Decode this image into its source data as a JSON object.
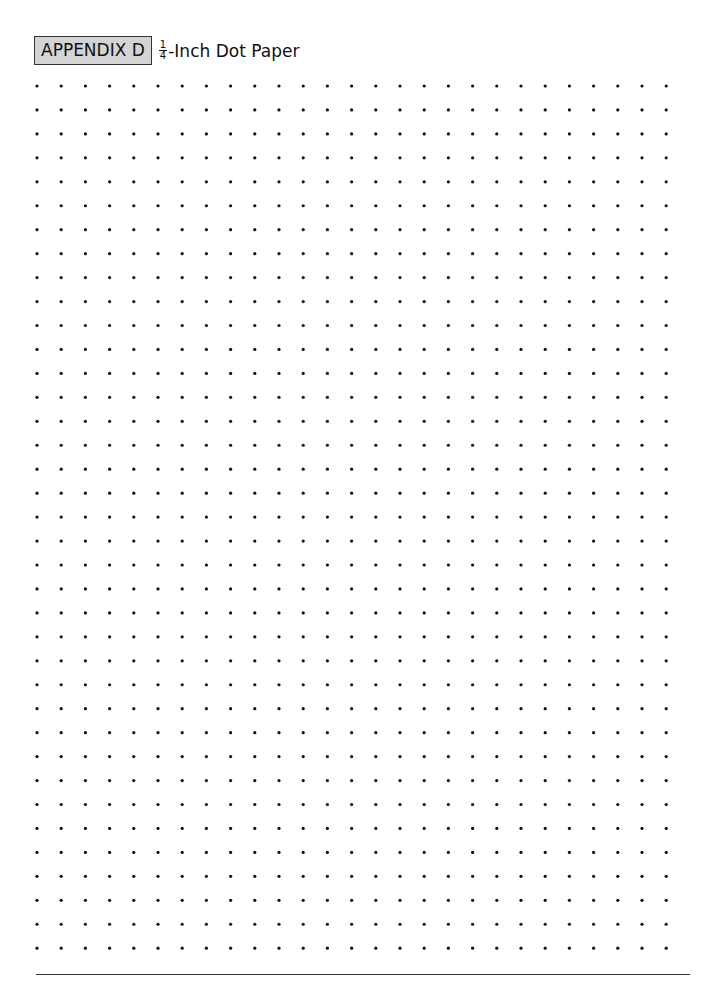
{
  "header": {
    "appendix_label": "APPENDIX D",
    "fraction_numerator": "1",
    "fraction_denominator": "4",
    "title_rest": "-Inch Dot Paper"
  },
  "dot_grid": {
    "columns": 27,
    "rows": 37,
    "start_x": 37,
    "start_y": 86,
    "spacing_x": 24.2,
    "spacing_y": 23.95,
    "dot_radius": 1.6,
    "dot_color": "#111111"
  },
  "colors": {
    "appendix_box_bg": "#d4d4d4",
    "rule": "#333333"
  }
}
